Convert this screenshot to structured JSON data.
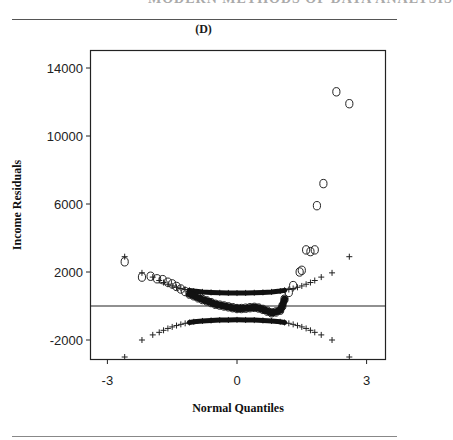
{
  "page": {
    "panel_label": "(D)"
  },
  "chart_data": {
    "type": "scatter",
    "title": "(D)",
    "xlabel": "Normal Quantiles",
    "ylabel": "Income  Residuals",
    "xlim": [
      -3.3,
      3.65
    ],
    "ylim": [
      -3100,
      15000
    ],
    "xticks": [
      -3,
      0,
      3
    ],
    "xtick_labels": [
      "-3",
      "0",
      "3"
    ],
    "yticks": [
      14000,
      10000,
      6000,
      2000,
      -2000
    ],
    "ytick_labels": [
      "14000",
      "10000",
      "6000",
      "2000",
      "-2000"
    ],
    "reference_line": {
      "y": 0
    },
    "grid": false,
    "legend": null,
    "series": [
      {
        "name": "Residuals (circles)",
        "marker": "o",
        "points": [
          [
            -2.6,
            2600
          ],
          [
            -2.2,
            1700
          ],
          [
            -2.0,
            1750
          ],
          [
            -1.85,
            1600
          ],
          [
            -1.72,
            1550
          ],
          [
            -1.6,
            1400
          ],
          [
            -1.5,
            1300
          ],
          [
            -1.4,
            1150
          ],
          [
            -1.3,
            1000
          ],
          [
            -1.2,
            850
          ],
          [
            -1.1,
            700
          ],
          [
            -1.0,
            600
          ],
          [
            -0.9,
            480
          ],
          [
            -0.8,
            380
          ],
          [
            -0.7,
            300
          ],
          [
            -0.6,
            200
          ],
          [
            -0.5,
            100
          ],
          [
            -0.4,
            50
          ],
          [
            -0.3,
            0
          ],
          [
            -0.2,
            -50
          ],
          [
            -0.1,
            -100
          ],
          [
            0.0,
            -150
          ],
          [
            0.1,
            -150
          ],
          [
            0.2,
            -130
          ],
          [
            0.3,
            -100
          ],
          [
            0.4,
            -80
          ],
          [
            0.5,
            -120
          ],
          [
            0.6,
            -200
          ],
          [
            0.7,
            -300
          ],
          [
            0.8,
            -400
          ],
          [
            0.9,
            -350
          ],
          [
            1.0,
            -250
          ],
          [
            1.05,
            0
          ],
          [
            1.1,
            400
          ],
          [
            1.2,
            800
          ],
          [
            1.3,
            1200
          ],
          [
            1.45,
            2000
          ],
          [
            1.5,
            2100
          ],
          [
            1.6,
            3300
          ],
          [
            1.7,
            3200
          ],
          [
            1.8,
            3300
          ],
          [
            1.85,
            5900
          ],
          [
            2.0,
            7200
          ],
          [
            2.3,
            12600
          ],
          [
            2.6,
            11900
          ]
        ]
      },
      {
        "name": "Upper envelope (+)",
        "marker": "+",
        "points": [
          [
            -2.6,
            2900
          ],
          [
            -2.2,
            1950
          ],
          [
            -1.95,
            1700
          ],
          [
            -1.8,
            1500
          ],
          [
            -1.7,
            1380
          ],
          [
            -1.6,
            1280
          ],
          [
            -1.5,
            1180
          ],
          [
            -1.4,
            1100
          ],
          [
            -1.3,
            1030
          ],
          [
            -1.2,
            970
          ],
          [
            -1.1,
            920
          ],
          [
            -1.0,
            880
          ],
          [
            -0.8,
            830
          ],
          [
            -0.6,
            800
          ],
          [
            -0.4,
            780
          ],
          [
            -0.2,
            770
          ],
          [
            0.0,
            760
          ],
          [
            0.2,
            770
          ],
          [
            0.4,
            780
          ],
          [
            0.6,
            800
          ],
          [
            0.8,
            830
          ],
          [
            1.0,
            880
          ],
          [
            1.1,
            920
          ],
          [
            1.2,
            970
          ],
          [
            1.3,
            1030
          ],
          [
            1.4,
            1100
          ],
          [
            1.5,
            1180
          ],
          [
            1.6,
            1280
          ],
          [
            1.7,
            1380
          ],
          [
            1.8,
            1500
          ],
          [
            1.95,
            1700
          ],
          [
            2.2,
            1950
          ],
          [
            2.6,
            2900
          ]
        ]
      },
      {
        "name": "Lower envelope (+)",
        "marker": "+",
        "points": [
          [
            -2.6,
            -3000
          ],
          [
            -2.2,
            -2000
          ],
          [
            -1.95,
            -1700
          ],
          [
            -1.8,
            -1550
          ],
          [
            -1.7,
            -1430
          ],
          [
            -1.6,
            -1320
          ],
          [
            -1.5,
            -1230
          ],
          [
            -1.4,
            -1150
          ],
          [
            -1.3,
            -1080
          ],
          [
            -1.2,
            -1020
          ],
          [
            -1.1,
            -970
          ],
          [
            -1.0,
            -930
          ],
          [
            -0.8,
            -880
          ],
          [
            -0.6,
            -850
          ],
          [
            -0.4,
            -830
          ],
          [
            -0.2,
            -820
          ],
          [
            0.0,
            -815
          ],
          [
            0.2,
            -820
          ],
          [
            0.4,
            -830
          ],
          [
            0.6,
            -850
          ],
          [
            0.8,
            -880
          ],
          [
            1.0,
            -930
          ],
          [
            1.1,
            -970
          ],
          [
            1.2,
            -1020
          ],
          [
            1.3,
            -1080
          ],
          [
            1.4,
            -1150
          ],
          [
            1.5,
            -1230
          ],
          [
            1.6,
            -1320
          ],
          [
            1.7,
            -1430
          ],
          [
            1.8,
            -1550
          ],
          [
            1.95,
            -1700
          ],
          [
            2.2,
            -2000
          ],
          [
            2.6,
            -3000
          ]
        ]
      }
    ]
  }
}
